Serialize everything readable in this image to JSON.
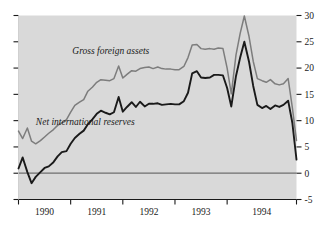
{
  "chart_data": {
    "type": "line",
    "title": "",
    "subtitle": "",
    "xlabel": "",
    "ylabel": "",
    "xlim": [
      1989.5,
      1994.83
    ],
    "ylim": [
      -5,
      30
    ],
    "yticks": [
      -5,
      0,
      5,
      10,
      15,
      20,
      25,
      30
    ],
    "ytick_labels": [
      "-5",
      "0",
      "5",
      "10",
      "15",
      "20",
      "25",
      "30"
    ],
    "ytick_side": "right",
    "xticks": [
      1989.5,
      1990.5,
      1991.5,
      1992.5,
      1993.5,
      1994.83
    ],
    "xtick_labels": [
      "",
      "",
      "",
      "",
      "",
      ""
    ],
    "xcategory_labels": [
      "1990",
      "1991",
      "1992",
      "1993",
      "1994"
    ],
    "grid": false,
    "legend": "inline-annotations",
    "zero_line": 0,
    "plot_background": "#d9d9d9",
    "figure_background": "#ffffff",
    "series": [
      {
        "name": "Gross foreign assets",
        "color": "#7d7d7d",
        "label_x": 1991.27,
        "label_y": 22.6,
        "x": [
          1989.5,
          1989.58,
          1989.67,
          1989.75,
          1989.83,
          1989.92,
          1990.0,
          1990.08,
          1990.17,
          1990.25,
          1990.33,
          1990.42,
          1990.5,
          1990.58,
          1990.67,
          1990.75,
          1990.83,
          1990.92,
          1991.0,
          1991.08,
          1991.17,
          1991.25,
          1991.33,
          1991.42,
          1991.5,
          1991.58,
          1991.67,
          1991.75,
          1991.83,
          1991.92,
          1992.0,
          1992.08,
          1992.17,
          1992.25,
          1992.33,
          1992.42,
          1992.5,
          1992.58,
          1992.67,
          1992.75,
          1992.83,
          1992.92,
          1993.0,
          1993.08,
          1993.17,
          1993.25,
          1993.33,
          1993.42,
          1993.5,
          1993.58,
          1993.67,
          1993.75,
          1993.83,
          1993.92,
          1994.0,
          1994.08,
          1994.17,
          1994.25,
          1994.33,
          1994.42,
          1994.5,
          1994.58,
          1994.67,
          1994.75,
          1994.83
        ],
        "values": [
          8.0,
          6.6,
          8.6,
          6.1,
          5.6,
          6.2,
          6.9,
          7.6,
          8.3,
          9.1,
          9.6,
          10.2,
          11.6,
          12.9,
          13.5,
          14.0,
          15.6,
          16.4,
          17.3,
          17.8,
          17.7,
          17.6,
          18.0,
          20.4,
          18.1,
          18.8,
          19.5,
          19.4,
          19.9,
          20.1,
          20.2,
          19.9,
          20.2,
          19.9,
          19.8,
          19.8,
          19.7,
          19.7,
          20.3,
          22.0,
          24.4,
          24.5,
          23.7,
          23.6,
          23.7,
          23.6,
          23.8,
          23.7,
          20.0,
          15.1,
          22.5,
          26.6,
          29.9,
          26.0,
          21.3,
          18.0,
          17.6,
          17.3,
          17.8,
          17.0,
          16.8,
          17.0,
          18.0,
          12.5,
          6.2
        ]
      },
      {
        "name": "Net international reserves",
        "color": "#1a1a1a",
        "label_x": 1990.78,
        "label_y": 9.2,
        "x": [
          1989.5,
          1989.58,
          1989.67,
          1989.75,
          1989.83,
          1989.92,
          1990.0,
          1990.08,
          1990.17,
          1990.25,
          1990.33,
          1990.42,
          1990.5,
          1990.58,
          1990.67,
          1990.75,
          1990.83,
          1990.92,
          1991.0,
          1991.08,
          1991.17,
          1991.25,
          1991.33,
          1991.42,
          1991.5,
          1991.58,
          1991.67,
          1991.75,
          1991.83,
          1991.92,
          1992.0,
          1992.08,
          1992.17,
          1992.25,
          1992.33,
          1992.42,
          1992.5,
          1992.58,
          1992.67,
          1992.75,
          1992.83,
          1992.92,
          1993.0,
          1993.08,
          1993.17,
          1993.25,
          1993.33,
          1993.42,
          1993.5,
          1993.58,
          1993.67,
          1993.75,
          1993.83,
          1993.92,
          1994.0,
          1994.08,
          1994.17,
          1994.25,
          1994.33,
          1994.42,
          1994.5,
          1994.58,
          1994.67,
          1994.75,
          1994.83
        ],
        "values": [
          0.9,
          3.0,
          0.2,
          -1.9,
          -0.7,
          0.2,
          1.0,
          1.3,
          2.1,
          3.2,
          4.0,
          4.2,
          5.6,
          6.7,
          7.5,
          8.1,
          9.3,
          10.3,
          11.3,
          11.9,
          11.5,
          11.2,
          11.6,
          14.5,
          11.7,
          12.6,
          13.5,
          12.6,
          13.6,
          12.7,
          13.2,
          13.2,
          13.3,
          13.0,
          13.1,
          13.2,
          13.1,
          13.1,
          13.7,
          15.3,
          19.0,
          19.4,
          18.2,
          18.1,
          18.2,
          18.7,
          18.7,
          18.6,
          16.2,
          12.7,
          18.5,
          22.0,
          25.0,
          21.2,
          16.6,
          13.0,
          12.4,
          12.8,
          12.2,
          12.9,
          12.6,
          13.0,
          13.8,
          9.6,
          2.6
        ]
      }
    ]
  }
}
